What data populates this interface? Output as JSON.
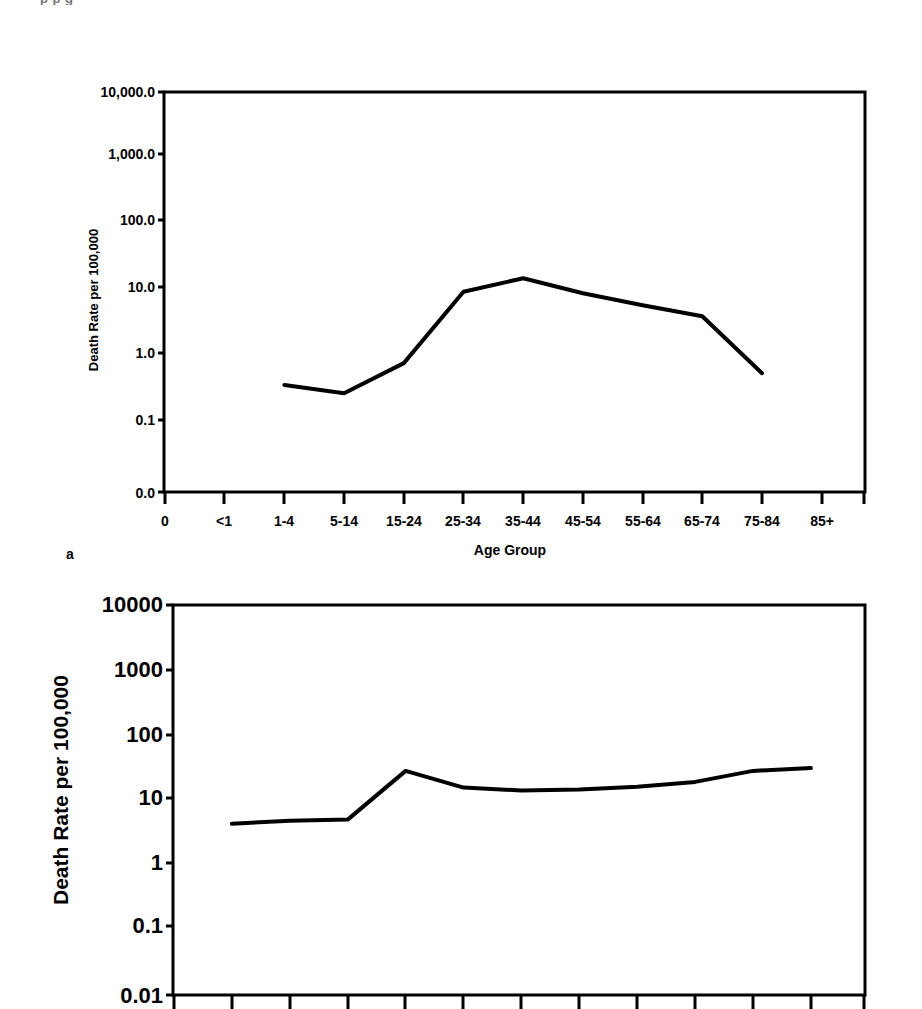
{
  "figure": {
    "top_clipped_text": "p    p      g",
    "panel_a_label": "a"
  },
  "chart_data": [
    {
      "id": "chart-a",
      "type": "line",
      "title": "",
      "xlabel": "Age Group",
      "ylabel": "Death Rate per 100,000",
      "yscale": "log",
      "grid": false,
      "legend": "none",
      "categories": [
        "0",
        "<1",
        "1-4",
        "5-14",
        "15-24",
        "25-34",
        "35-44",
        "45-54",
        "55-64",
        "65-74",
        "75-84",
        "85+"
      ],
      "ytick_labels": [
        "10,000.0",
        "1,000.0",
        "100.0",
        "10.0",
        "1.0",
        "0.1",
        "0.0"
      ],
      "ytick_values": [
        10000.0,
        1000.0,
        100.0,
        10.0,
        1.0,
        0.1,
        0.0
      ],
      "ylim": [
        0.0,
        10000.0
      ],
      "values": [
        null,
        null,
        0.4,
        0.3,
        0.85,
        10.0,
        16.0,
        9.5,
        6.3,
        4.3,
        0.6,
        null
      ],
      "series": [
        {
          "name": "Death Rate",
          "points": [
            {
              "category": "1-4",
              "value": 0.4
            },
            {
              "category": "5-14",
              "value": 0.3
            },
            {
              "category": "15-24",
              "value": 0.85
            },
            {
              "category": "25-34",
              "value": 10.0
            },
            {
              "category": "35-44",
              "value": 16.0
            },
            {
              "category": "45-54",
              "value": 9.5
            },
            {
              "category": "55-64",
              "value": 6.3
            },
            {
              "category": "65-74",
              "value": 4.3
            },
            {
              "category": "75-84",
              "value": 0.6
            }
          ]
        }
      ]
    },
    {
      "id": "chart-b",
      "type": "line",
      "title": "",
      "xlabel": "",
      "ylabel": "Death Rate per 100,000",
      "yscale": "log",
      "grid": false,
      "legend": "none",
      "categories": [
        "0",
        "<1",
        "1-4",
        "5-14",
        "15-24",
        "25-34",
        "35-44",
        "45-54",
        "55-64",
        "65-74",
        "75-84",
        "85+"
      ],
      "ytick_labels": [
        "10000",
        "1000",
        "100",
        "10",
        "1",
        "0.1",
        "0.01"
      ],
      "ytick_values": [
        10000,
        1000,
        100,
        10,
        1,
        0.1,
        0.01
      ],
      "ylim": [
        0.01,
        10000
      ],
      "values": [
        null,
        4.3,
        4.8,
        5.0,
        28.0,
        15.5,
        14.0,
        14.5,
        16.0,
        19.0,
        28.0,
        31.0
      ],
      "series": [
        {
          "name": "Death Rate",
          "points": [
            {
              "category": "<1",
              "value": 4.3
            },
            {
              "category": "1-4",
              "value": 4.8
            },
            {
              "category": "5-14",
              "value": 5.0
            },
            {
              "category": "15-24",
              "value": 28.0
            },
            {
              "category": "25-34",
              "value": 15.5
            },
            {
              "category": "35-44",
              "value": 14.0
            },
            {
              "category": "45-54",
              "value": 14.5
            },
            {
              "category": "55-64",
              "value": 16.0
            },
            {
              "category": "65-74",
              "value": 19.0
            },
            {
              "category": "75-84",
              "value": 28.0
            },
            {
              "category": "85+",
              "value": 31.0
            }
          ]
        }
      ]
    }
  ],
  "colors": {
    "line": "#000000",
    "axis": "#000000",
    "background": "#ffffff"
  }
}
